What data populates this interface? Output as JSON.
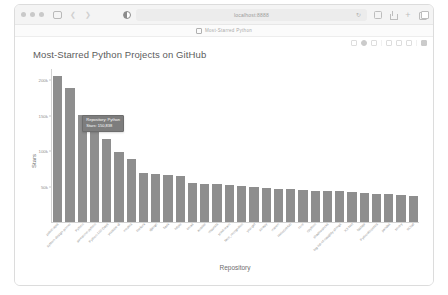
{
  "browser": {
    "traffic_lights": [
      "close",
      "minimize",
      "maximize"
    ],
    "sidebar_icon": "sidebar-icon",
    "back_icon": "chevron-left-icon",
    "forward_icon": "chevron-right-icon",
    "reader_icon": "reader-mode-icon",
    "url_text": "localhost:8888",
    "url_placeholder": "Search or enter website name",
    "reload_icon": "reload-icon",
    "right_icons": [
      "download-icon",
      "share-icon",
      "new-tab-icon",
      "tab-overview-icon"
    ],
    "bookmark_favicon": "page-favicon",
    "bookmark_text": "Most-Starred Python"
  },
  "mpl_toolbar": {
    "icons": [
      "home-icon",
      "pan-icon",
      "zoom-icon",
      "configure-icon",
      "save-icon",
      "back-icon",
      "forward-icon",
      "download-icon"
    ]
  },
  "chart_data": {
    "type": "bar",
    "title": "Most-Starred Python Projects on GitHub",
    "xlabel": "Repository",
    "ylabel": "Stars",
    "ylim": [
      0,
      215000
    ],
    "grid": false,
    "legend": null,
    "ytick_labels": [
      "200k",
      "150k",
      "100k",
      "50k"
    ],
    "ytick_values": [
      200000,
      150000,
      100000,
      50000
    ],
    "bar_color": "#8e8e8e",
    "categories": [
      "public-apis",
      "system-design-primer",
      "Python",
      "awesome-python",
      "Python-100-Days",
      "youtube-dl",
      "models",
      "thefuck",
      "django",
      "flask",
      "httpie",
      "keras",
      "ansible",
      "requests",
      "scikit-learn",
      "face_recognition",
      "you-get",
      "scrapy",
      "manim",
      "HelloGitHub",
      "core",
      "cpython",
      "shadowsocks",
      "big-list-of-naughty-strings",
      "XX-Net",
      "fastapi",
      "PythonRobotics",
      "pandas",
      "sentry",
      "ItChat"
    ],
    "values": [
      205000,
      188000,
      150838,
      129000,
      116000,
      98000,
      88000,
      69000,
      68000,
      66000,
      65000,
      55000,
      54000,
      53000,
      52000,
      51000,
      49000,
      48000,
      47000,
      46000,
      45000,
      44000,
      43000,
      43000,
      42000,
      41000,
      40000,
      39000,
      38000,
      37000
    ]
  },
  "tooltip": {
    "visible": true,
    "repository_line": "Repository: Python",
    "stars_line": "Stars: 150,838",
    "bar_index": 2
  }
}
